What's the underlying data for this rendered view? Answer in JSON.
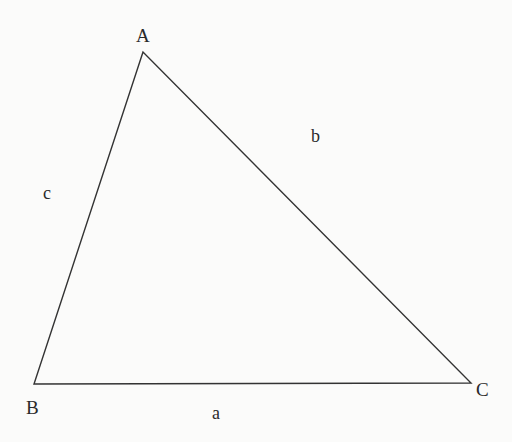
{
  "diagram": {
    "type": "triangle",
    "colors": {
      "background": "#fbfbfa",
      "stroke": "#333333",
      "text": "#2a2a2a"
    },
    "vertices": {
      "A": {
        "label": "A",
        "x": 143,
        "y": 52
      },
      "B": {
        "label": "B",
        "x": 34,
        "y": 384
      },
      "C": {
        "label": "C",
        "x": 471,
        "y": 383
      }
    },
    "sides": {
      "a": {
        "label": "a",
        "from": "B",
        "to": "C"
      },
      "b": {
        "label": "b",
        "from": "A",
        "to": "C"
      },
      "c": {
        "label": "c",
        "from": "A",
        "to": "B"
      }
    }
  }
}
